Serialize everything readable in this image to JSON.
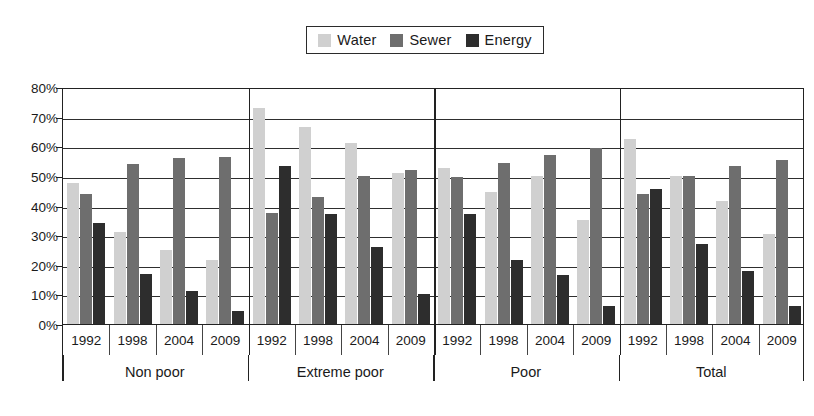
{
  "legend": {
    "entries": [
      {
        "label": "Water",
        "color": "#d0d0d0",
        "icon": "water-swatch-icon"
      },
      {
        "label": "Sewer",
        "color": "#6e6e6e",
        "icon": "sewer-swatch-icon"
      },
      {
        "label": "Energy",
        "color": "#2d2d2d",
        "icon": "energy-swatch-icon"
      }
    ]
  },
  "axis": {
    "y_ticks": [
      "0%",
      "10%",
      "20%",
      "30%",
      "40%",
      "50%",
      "60%",
      "70%",
      "80%"
    ],
    "y_min": 0,
    "y_max": 80
  },
  "chart_data": {
    "type": "bar",
    "title": "",
    "xlabel": "",
    "ylabel": "",
    "ylim": [
      0,
      80
    ],
    "ytick_labels": [
      "0%",
      "10%",
      "20%",
      "30%",
      "40%",
      "50%",
      "60%",
      "70%",
      "80%"
    ],
    "grid": true,
    "legend_position": "top-center",
    "group_labels": [
      "Non poor",
      "Extreme poor",
      "Poor",
      "Total"
    ],
    "categories": [
      "Non poor 1992",
      "Non poor 1998",
      "Non poor 2004",
      "Non poor 2009",
      "Extreme poor 1992",
      "Extreme poor 1998",
      "Extreme poor 2004",
      "Extreme poor 2009",
      "Poor 1992",
      "Poor 1998",
      "Poor 2004",
      "Poor 2009",
      "Total 1992",
      "Total 1998",
      "Total 2004",
      "Total 2009"
    ],
    "x": [
      "1992",
      "1998",
      "2004",
      "2009",
      "1992",
      "1998",
      "2004",
      "2009",
      "1992",
      "1998",
      "2004",
      "2009",
      "1992",
      "1998",
      "2004",
      "2009"
    ],
    "series": [
      {
        "name": "Water",
        "color": "#d0d0d0",
        "values": [
          47.5,
          31.0,
          25.0,
          21.5,
          73.0,
          66.5,
          61.0,
          51.0,
          52.5,
          44.5,
          50.0,
          35.0,
          62.5,
          50.0,
          41.5,
          30.5
        ]
      },
      {
        "name": "Sewer",
        "color": "#6e6e6e",
        "values": [
          44.0,
          54.0,
          56.0,
          56.5,
          37.5,
          43.0,
          50.0,
          52.0,
          49.5,
          54.5,
          57.0,
          59.5,
          44.0,
          50.0,
          53.5,
          55.5
        ]
      },
      {
        "name": "Energy",
        "color": "#2d2d2d",
        "values": [
          34.0,
          17.0,
          11.0,
          4.5,
          53.5,
          37.0,
          26.0,
          10.0,
          37.0,
          21.5,
          16.5,
          6.0,
          45.5,
          27.0,
          18.0,
          6.0
        ]
      }
    ],
    "groups": [
      {
        "label": "Non poor",
        "years": [
          "1992",
          "1998",
          "2004",
          "2009"
        ],
        "Water": [
          47.5,
          31.0,
          25.0,
          21.5
        ],
        "Sewer": [
          44.0,
          54.0,
          56.0,
          56.5
        ],
        "Energy": [
          34.0,
          17.0,
          11.0,
          4.5
        ]
      },
      {
        "label": "Extreme poor",
        "years": [
          "1992",
          "1998",
          "2004",
          "2009"
        ],
        "Water": [
          73.0,
          66.5,
          61.0,
          51.0
        ],
        "Sewer": [
          37.5,
          43.0,
          50.0,
          52.0
        ],
        "Energy": [
          53.5,
          37.0,
          26.0,
          10.0
        ]
      },
      {
        "label": "Poor",
        "years": [
          "1992",
          "1998",
          "2004",
          "2009"
        ],
        "Water": [
          52.5,
          44.5,
          50.0,
          35.0
        ],
        "Sewer": [
          49.5,
          54.5,
          57.0,
          59.5
        ],
        "Energy": [
          37.0,
          21.5,
          16.5,
          6.0
        ]
      },
      {
        "label": "Total",
        "years": [
          "1992",
          "1998",
          "2004",
          "2009"
        ],
        "Water": [
          62.5,
          50.0,
          41.5,
          30.5
        ],
        "Sewer": [
          44.0,
          50.0,
          53.5,
          55.5
        ],
        "Energy": [
          45.5,
          27.0,
          18.0,
          6.0
        ]
      }
    ]
  }
}
